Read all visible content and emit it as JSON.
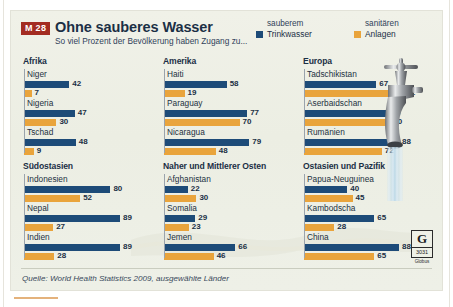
{
  "badge": "M 28",
  "title": "Ohne sauberes Wasser",
  "subtitle": "So viel Prozent der Bevölkerung haben Zugang zu...",
  "legend": [
    {
      "top": "sauberem",
      "bottom": "Trinkwasser",
      "color": "#1d4b78",
      "key": "water"
    },
    {
      "top": "sanitären",
      "bottom": "Anlagen",
      "color": "#e9a43c",
      "key": "sanit"
    }
  ],
  "source": "Quelle: World Health Statistics 2009, ausgewählte Länder",
  "logo": {
    "letter": "G",
    "number": "3031",
    "caption": "Globus"
  },
  "colors": {
    "water": "#1d4b78",
    "sanitation": "#e9a43c",
    "badge": "#a32c22",
    "panel": "#eef0e6",
    "text": "#1b2f45"
  },
  "chart_data": {
    "type": "bar",
    "title": "Ohne sauberes Wasser",
    "subtitle": "So viel Prozent der Bevölkerung haben Zugang zu...",
    "xlabel": "",
    "ylabel": "Prozent der Bevölkerung",
    "xlim": [
      0,
      100
    ],
    "grid": false,
    "legend_position": "top-right",
    "series_names": [
      "sauberem Trinkwasser",
      "sanitären Anlagen"
    ],
    "units": "%",
    "source": "World Health Statistics 2009, ausgewählte Länder",
    "regions": [
      {
        "name": "Afrika",
        "countries": [
          {
            "name": "Niger",
            "water": 42,
            "sanitation": 7
          },
          {
            "name": "Nigeria",
            "water": 47,
            "sanitation": 30
          },
          {
            "name": "Tschad",
            "water": 48,
            "sanitation": 9
          }
        ]
      },
      {
        "name": "Amerika",
        "countries": [
          {
            "name": "Haiti",
            "water": 58,
            "sanitation": 19
          },
          {
            "name": "Paraguay",
            "water": 77,
            "sanitation": 70
          },
          {
            "name": "Nicaragua",
            "water": 79,
            "sanitation": 48
          }
        ]
      },
      {
        "name": "Europa",
        "countries": [
          {
            "name": "Tadschikistan",
            "water": 67,
            "sanitation": 92
          },
          {
            "name": "Aserbaidschan",
            "water": 78,
            "sanitation": 80
          },
          {
            "name": "Rumänien",
            "water": 88,
            "sanitation": 72
          }
        ]
      },
      {
        "name": "Südostasien",
        "countries": [
          {
            "name": "Indonesien",
            "water": 80,
            "sanitation": 52
          },
          {
            "name": "Nepal",
            "water": 89,
            "sanitation": 27
          },
          {
            "name": "Indien",
            "water": 89,
            "sanitation": 28
          }
        ]
      },
      {
        "name": "Naher und Mittlerer Osten",
        "countries": [
          {
            "name": "Afghanistan",
            "water": 22,
            "sanitation": 30
          },
          {
            "name": "Somalia",
            "water": 29,
            "sanitation": 23
          },
          {
            "name": "Jemen",
            "water": 66,
            "sanitation": 46
          }
        ]
      },
      {
        "name": "Ostasien und Pazifik",
        "countries": [
          {
            "name": "Papua-Neuguinea",
            "water": 40,
            "sanitation": 45
          },
          {
            "name": "Kambodscha",
            "water": 65,
            "sanitation": 28
          },
          {
            "name": "China",
            "water": 88,
            "sanitation": 65
          }
        ]
      }
    ]
  }
}
